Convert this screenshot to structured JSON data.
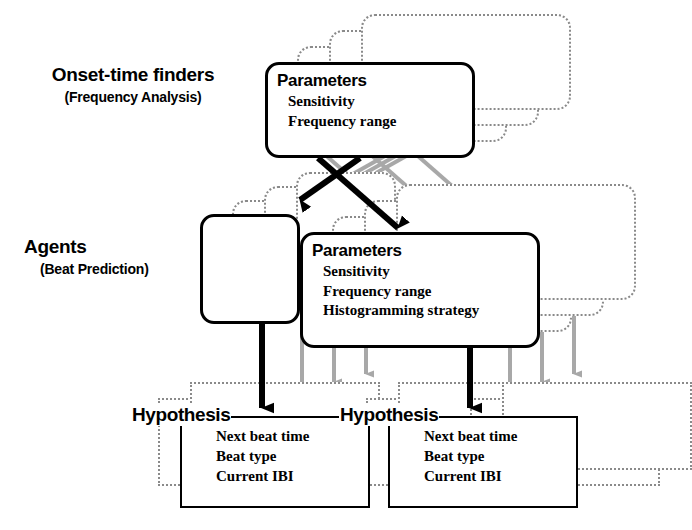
{
  "diagram": {
    "rows": [
      {
        "name": "onset-row",
        "main": "Onset-time finders",
        "sub": "(Frequency Analysis)"
      },
      {
        "name": "agents-row",
        "main": "Agents",
        "sub": "(Beat Prediction)"
      }
    ],
    "onset_parameters": {
      "title": "Parameters",
      "items": [
        "Sensitivity",
        "Frequency range"
      ],
      "ghost_count": 3
    },
    "agent_box": {
      "ghost_count": 3
    },
    "agent_parameters": {
      "title": "Parameters",
      "items": [
        "Sensitivity",
        "Frequency range",
        "Histogramming strategy"
      ],
      "ghost_count": 3
    },
    "hypotheses": [
      {
        "title": "Hypothesis",
        "items": [
          "Next beat time",
          "Beat type",
          "Current IBI"
        ],
        "ghost_count": 2
      },
      {
        "title": "Hypothesis",
        "items": [
          "Next beat time",
          "Beat type",
          "Current IBI"
        ],
        "ghost_count": 2
      }
    ],
    "colors": {
      "ink": "#000000",
      "ghost": "#8a8a8a",
      "paper": "#ffffff"
    }
  }
}
